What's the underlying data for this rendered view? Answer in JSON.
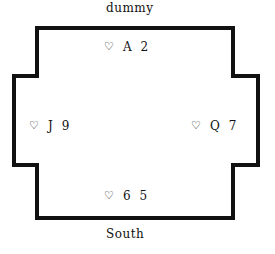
{
  "diagram": {
    "type": "bridge-hand-layout",
    "stroke_color": "#111111",
    "positions": {
      "north": {
        "label": "dummy",
        "suit_symbol": "♡",
        "suit_name": "hearts",
        "cards": [
          "A",
          "2"
        ]
      },
      "west": {
        "suit_symbol": "♡",
        "suit_name": "hearts",
        "cards": [
          "J",
          "9"
        ]
      },
      "east": {
        "suit_symbol": "♡",
        "suit_name": "hearts",
        "cards": [
          "Q",
          "7"
        ]
      },
      "south": {
        "label": "South",
        "suit_symbol": "♡",
        "suit_name": "hearts",
        "cards": [
          "6",
          "5"
        ]
      }
    }
  }
}
